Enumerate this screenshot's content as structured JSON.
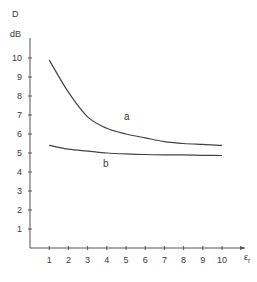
{
  "chart_data": {
    "type": "line",
    "title": "",
    "xlabel": "εr",
    "ylabel": "D",
    "yunit": "dB",
    "xlim": [
      0,
      11.5
    ],
    "ylim": [
      0,
      11
    ],
    "xticks": [
      1,
      2,
      3,
      4,
      5,
      6,
      7,
      8,
      9,
      10
    ],
    "yticks": [
      1,
      2,
      3,
      4,
      5,
      6,
      7,
      8,
      9,
      10
    ],
    "grid": false,
    "legend": "none (curves labeled inline)",
    "x": [
      1,
      2,
      3,
      4,
      5,
      6,
      7,
      8,
      9,
      10
    ],
    "series": [
      {
        "name": "a",
        "values": [
          9.9,
          8.2,
          6.9,
          6.3,
          6.0,
          5.8,
          5.6,
          5.5,
          5.45,
          5.4
        ],
        "label_pos": [
          4.9,
          6.9
        ]
      },
      {
        "name": "b",
        "values": [
          5.4,
          5.2,
          5.1,
          5.0,
          4.95,
          4.92,
          4.9,
          4.9,
          4.88,
          4.87
        ],
        "label_pos": [
          3.8,
          4.4
        ]
      }
    ]
  },
  "labels": {
    "y_title": "D",
    "y_unit": "dB",
    "x_title_main": "ε",
    "x_title_sub": "r",
    "curve_a": "a",
    "curve_b": "b"
  }
}
